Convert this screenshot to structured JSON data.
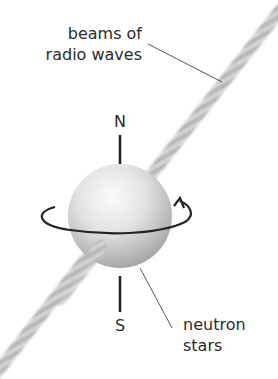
{
  "labels": {
    "beams_line1": "beams of",
    "beams_line2": "radio waves",
    "north": "N",
    "south": "S",
    "neutron_line1": "neutron",
    "neutron_line2": "stars"
  },
  "colors": {
    "beam": "#bdbdbd",
    "sphere_light": "#f7f7f7",
    "sphere_dark": "#9a9a9a",
    "axis": "#222222",
    "text": "#2b2b2b",
    "leader": "#555555"
  },
  "icons": {
    "rotation_arrow": "rotation-arrow-icon"
  }
}
